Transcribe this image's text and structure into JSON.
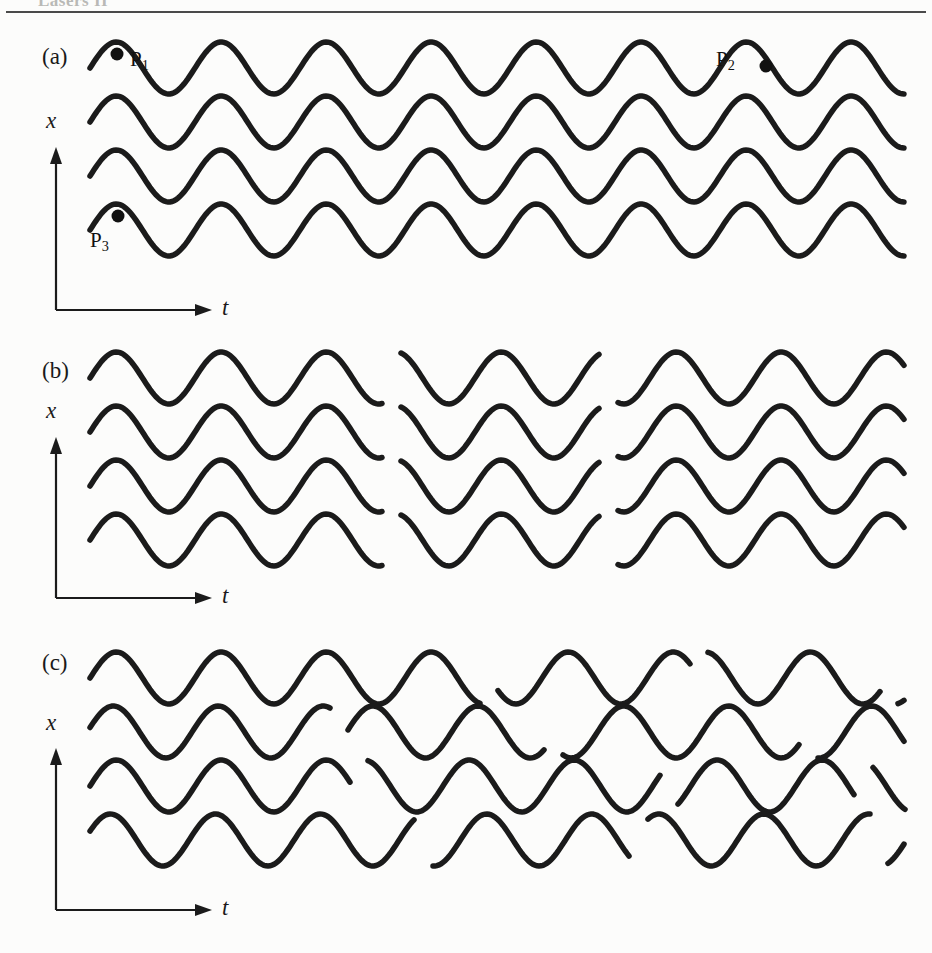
{
  "running_head": {
    "text": "Lasers II"
  },
  "figure": {
    "caption_visible": false,
    "background_color": "#fcfcfb",
    "ink_color": "#1b1b1b"
  },
  "panels": [
    {
      "id": "a",
      "label": "(a)",
      "label_x": 42,
      "label_y": 44,
      "axis": {
        "x_label": "x",
        "x_label_x": 46,
        "x_label_y": 108,
        "t_label": "t",
        "t_label_x": 222,
        "t_label_y": 295,
        "origin_x": 56,
        "origin_y": 310,
        "vertical_top_y": 147,
        "horizontal_right_x": 212
      },
      "wave": {
        "rows": 4,
        "row_baselines": [
          68,
          122,
          176,
          230
        ],
        "amplitude": 26,
        "period": 105,
        "phase_deg": 0,
        "stroke_width": 5.5,
        "x_start": 90,
        "x_end": 905,
        "breaks": []
      },
      "markers": [
        {
          "name": "P1",
          "label": "P",
          "subscript": "1",
          "x": 117,
          "y": 54,
          "label_x": 130,
          "label_y": 47
        },
        {
          "name": "P2",
          "label": "P",
          "subscript": "2",
          "x": 766,
          "y": 66,
          "label_x": 716,
          "label_y": 47
        },
        {
          "name": "P3",
          "label": "P",
          "subscript": "3",
          "x": 118,
          "y": 216,
          "label_x": 90,
          "label_y": 228
        }
      ]
    },
    {
      "id": "b",
      "label": "(b)",
      "label_x": 42,
      "label_y": 358,
      "axis": {
        "x_label": "x",
        "x_label_x": 46,
        "x_label_y": 398,
        "t_label": "t",
        "t_label_x": 222,
        "t_label_y": 583,
        "origin_x": 56,
        "origin_y": 598,
        "vertical_top_y": 437,
        "horizontal_right_x": 212
      },
      "wave": {
        "rows": 4,
        "row_baselines": [
          378,
          432,
          486,
          540
        ],
        "amplitude": 26,
        "period": 105,
        "phase_deg": 0,
        "stroke_width": 5.5,
        "x_start": 90,
        "x_end": 905,
        "break_columns": [
          383,
          600
        ],
        "break_gap": 18,
        "phase_jumps_deg": [
          0,
          120,
          240
        ],
        "correlated_across_rows": true
      },
      "markers": []
    },
    {
      "id": "c",
      "label": "(c)",
      "label_x": 42,
      "label_y": 650,
      "axis": {
        "x_label": "x",
        "x_label_x": 46,
        "x_label_y": 710,
        "t_label": "t",
        "t_label_x": 222,
        "t_label_y": 895,
        "origin_x": 56,
        "origin_y": 910,
        "vertical_top_y": 748,
        "horizontal_right_x": 212
      },
      "wave": {
        "rows": 4,
        "row_baselines": [
          678,
          732,
          786,
          840
        ],
        "amplitude": 26,
        "period": 105,
        "stroke_width": 5.5,
        "x_start": 90,
        "x_end": 905,
        "correlated_across_rows": false,
        "row_segments": [
          {
            "row": 0,
            "breaks": [
              480,
              690,
              880
            ],
            "phases_deg": [
              0,
              250,
              140,
              30
            ]
          },
          {
            "row": 1,
            "breaks": [
              330,
              545,
              800
            ],
            "phases_deg": [
              10,
              200,
              60,
              290
            ]
          },
          {
            "row": 2,
            "breaks": [
              350,
              660,
              855
            ],
            "phases_deg": [
              0,
              230,
              100,
              330
            ]
          },
          {
            "row": 3,
            "breaks": [
              415,
              630,
              870
            ],
            "phases_deg": [
              20,
              170,
              300,
              80
            ]
          }
        ],
        "break_gap": 18
      },
      "markers": []
    }
  ],
  "chart_data": {
    "type": "line",
    "title": "",
    "xlabel": "t",
    "ylabel": "x",
    "panels": [
      {
        "label": "(a)",
        "meaning": "Four wave trains perfectly in phase and continuous - fully coherent light",
        "n_traces": 4,
        "waveform": "sine",
        "period_px": 105,
        "amplitude_px": 26,
        "cycles_visible": 7.75,
        "phase_discontinuities": 0,
        "marked_points": [
          "P1",
          "P2",
          "P3"
        ]
      },
      {
        "label": "(b)",
        "meaning": "Wave trains broken by phase jumps occurring at the same instants in every trace - spatially coherent but limited temporal coherence",
        "n_traces": 4,
        "waveform": "sine",
        "period_px": 105,
        "amplitude_px": 26,
        "phase_discontinuities": 2,
        "discontinuities_aligned_across_traces": true
      },
      {
        "label": "(c)",
        "meaning": "Wave trains broken by phase jumps at random, uncorrelated instants in each trace - incoherent light",
        "n_traces": 4,
        "waveform": "sine",
        "period_px": 105,
        "amplitude_px": 26,
        "phase_discontinuities": 3,
        "discontinuities_aligned_across_traces": false
      }
    ]
  }
}
